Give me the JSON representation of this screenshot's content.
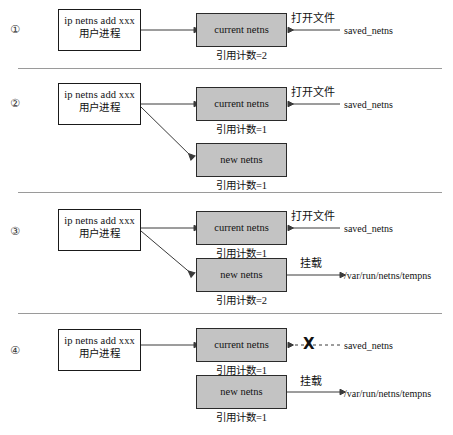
{
  "figure": {
    "boxes": {
      "process_line1": "ip netns add xxx",
      "process_line2": "用户进程",
      "current_netns": "current netns",
      "new_netns": "new netns"
    },
    "labels": {
      "open_file": "打开文件",
      "mount": "挂载",
      "saved_netns": "saved_netns",
      "tempns_path": "/var/run/netns/tempns",
      "x_mark": "X"
    },
    "refcount_prefix": "引用计数=",
    "colors": {
      "netns_box_fill": "#c3c3c3",
      "netns_box_border": "#2a2a2a",
      "process_box_border": "#1a1a1a",
      "connector": "#3a3a3a",
      "divider": "#9a9a9a",
      "page_background": "#ffffff"
    },
    "steps": [
      {
        "number": "①",
        "process_line1": "ip netns add xxx",
        "process_line2": "用户进程",
        "current_netns_label": "current netns",
        "current_netns_refcount": "引用计数=2",
        "new_netns_label": null,
        "new_netns_refcount": null,
        "open_file_label": "打开文件",
        "saved_netns_label": "saved_netns",
        "mount_label": null,
        "tempns_path": null,
        "has_diagonal_arrow_to_new": false,
        "saved_netns_link_broken": false
      },
      {
        "number": "②",
        "process_line1": "ip netns add xxx",
        "process_line2": "用户进程",
        "current_netns_label": "current netns",
        "current_netns_refcount": "引用计数=1",
        "new_netns_label": "new netns",
        "new_netns_refcount": "引用计数=1",
        "open_file_label": "打开文件",
        "saved_netns_label": "saved_netns",
        "mount_label": null,
        "tempns_path": null,
        "has_diagonal_arrow_to_new": true,
        "saved_netns_link_broken": false
      },
      {
        "number": "③",
        "process_line1": "ip netns add xxx",
        "process_line2": "用户进程",
        "current_netns_label": "current netns",
        "current_netns_refcount": "引用计数=1",
        "new_netns_label": "new netns",
        "new_netns_refcount": "引用计数=2",
        "open_file_label": "打开文件",
        "saved_netns_label": "saved_netns",
        "mount_label": "挂载",
        "tempns_path": "/var/run/netns/tempns",
        "has_diagonal_arrow_to_new": true,
        "saved_netns_link_broken": false
      },
      {
        "number": "④",
        "process_line1": "ip netns add xxx",
        "process_line2": "用户进程",
        "current_netns_label": "current netns",
        "current_netns_refcount": "引用计数=1",
        "new_netns_label": "new netns",
        "new_netns_refcount": "引用计数=1",
        "open_file_label": null,
        "saved_netns_label": "saved_netns",
        "mount_label": "挂载",
        "tempns_path": "/var/run/netns/tempns",
        "has_diagonal_arrow_to_new": false,
        "saved_netns_link_broken": true
      }
    ]
  }
}
